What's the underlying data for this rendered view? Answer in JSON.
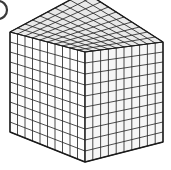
{
  "figure": {
    "alt_label": "10 by 10 by 10 unit cube",
    "type": "isometric-cube-diagram"
  },
  "cube": {
    "divisions_x": 10,
    "divisions_y": 10,
    "divisions_z": 10,
    "total_unit_cubes": 1000,
    "colors": {
      "line": "#2b2b2b",
      "top_face": "#e9e9e9",
      "left_face": "#fdfdfd",
      "right_face": "#f6f6f6",
      "outline": "#1a1a1a",
      "background": "#ffffff",
      "marker": "#3a3a3a"
    },
    "geometry": {
      "left_corner_x": 10,
      "left_corner_y": 32,
      "top_vertex_x": 85,
      "top_vertex_y": -8,
      "right_corner_x": 163,
      "right_corner_y": 42,
      "bottom_vertex_x": 85,
      "bottom_vertex_y": 162,
      "front_bottom_left_x": 10,
      "front_bottom_left_y": 132,
      "front_bottom_right_x": 163,
      "front_bottom_right_y": 142
    }
  },
  "marker": {
    "name": "cut-off-circle-marker",
    "center_x": -2,
    "center_y": 10,
    "radius": 9
  }
}
